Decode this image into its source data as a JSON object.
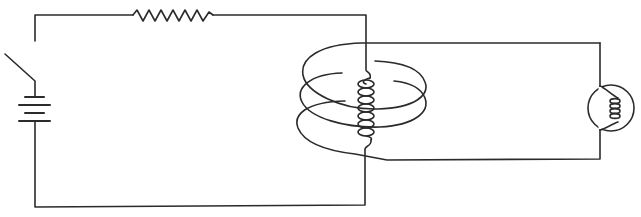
{
  "diagram": {
    "title": "Induction circuit: primary coil with switch, battery and resistor inside secondary coil connected to a lamp",
    "colors": {
      "background": "#ffffff",
      "stroke": "#2b2b2b"
    },
    "components": [
      {
        "id": "switch",
        "label": "Switch (open)",
        "type": "switch"
      },
      {
        "id": "battery",
        "label": "Battery",
        "type": "battery"
      },
      {
        "id": "resistor",
        "label": "Resistor",
        "type": "resistor"
      },
      {
        "id": "primary-coil",
        "label": "Primary coil (inner)",
        "type": "inductor"
      },
      {
        "id": "secondary-coil",
        "label": "Secondary coil (outer)",
        "type": "inductor"
      },
      {
        "id": "lamp",
        "label": "Light bulb",
        "type": "lamp"
      }
    ],
    "circuits": [
      {
        "name": "primary",
        "elements": [
          "switch",
          "battery",
          "resistor",
          "primary-coil"
        ]
      },
      {
        "name": "secondary",
        "elements": [
          "secondary-coil",
          "lamp"
        ]
      }
    ]
  }
}
